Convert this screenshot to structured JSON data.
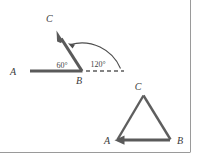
{
  "figure": {
    "background_color": "#ffffff",
    "ink_color": "#5a5a5a",
    "label_color": "#3b3b3b",
    "border_color": "#9a9a9a",
    "angle_diagram": {
      "name": "angle-abc-diagram",
      "vertex_label": "B",
      "ray_start_label": "A",
      "ray_end_label": "C",
      "interior_angle_label": "60°",
      "rotation_angle_label": "120°",
      "dashed_extension": "dashed-ray-extension",
      "arc": "rotation-arc"
    },
    "triangle_diagram": {
      "name": "triangle-abc",
      "vertex_a_label": "A",
      "vertex_b_label": "B",
      "vertex_c_label": "C"
    }
  }
}
